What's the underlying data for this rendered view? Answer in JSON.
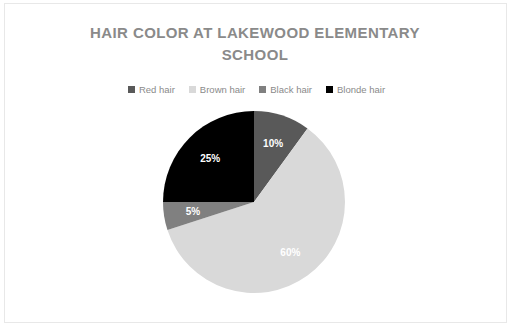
{
  "chart_data": {
    "type": "pie",
    "title": "HAIR COLOR AT LAKEWOOD ELEMENTARY SCHOOL",
    "title_line1": "HAIR COLOR AT LAKEWOOD ELEMENTARY",
    "title_line2": "SCHOOL",
    "categories": [
      "Red hair",
      "Brown hair",
      "Black hair",
      "Blonde hair"
    ],
    "values": [
      10,
      60,
      5,
      25
    ],
    "value_labels": [
      "10%",
      "60%",
      "5%",
      "25%"
    ],
    "colors": [
      "#595959",
      "#d9d9d9",
      "#808080",
      "#000000"
    ],
    "label_color": "#ffffff",
    "legend_position": "top",
    "start_angle_deg": 0,
    "direction": "clockwise",
    "units": "percent",
    "xlabel": "",
    "ylabel": ""
  },
  "panel": {
    "background": "#ffffff",
    "border_color": "#e8e8e8",
    "title_color": "#8a8a8a",
    "legend_text_color": "#8a8a8a"
  },
  "legend": [
    {
      "label": "Red hair",
      "color": "#595959"
    },
    {
      "label": "Brown hair",
      "color": "#d9d9d9"
    },
    {
      "label": "Black hair",
      "color": "#808080"
    },
    {
      "label": "Blonde hair",
      "color": "#000000"
    }
  ]
}
